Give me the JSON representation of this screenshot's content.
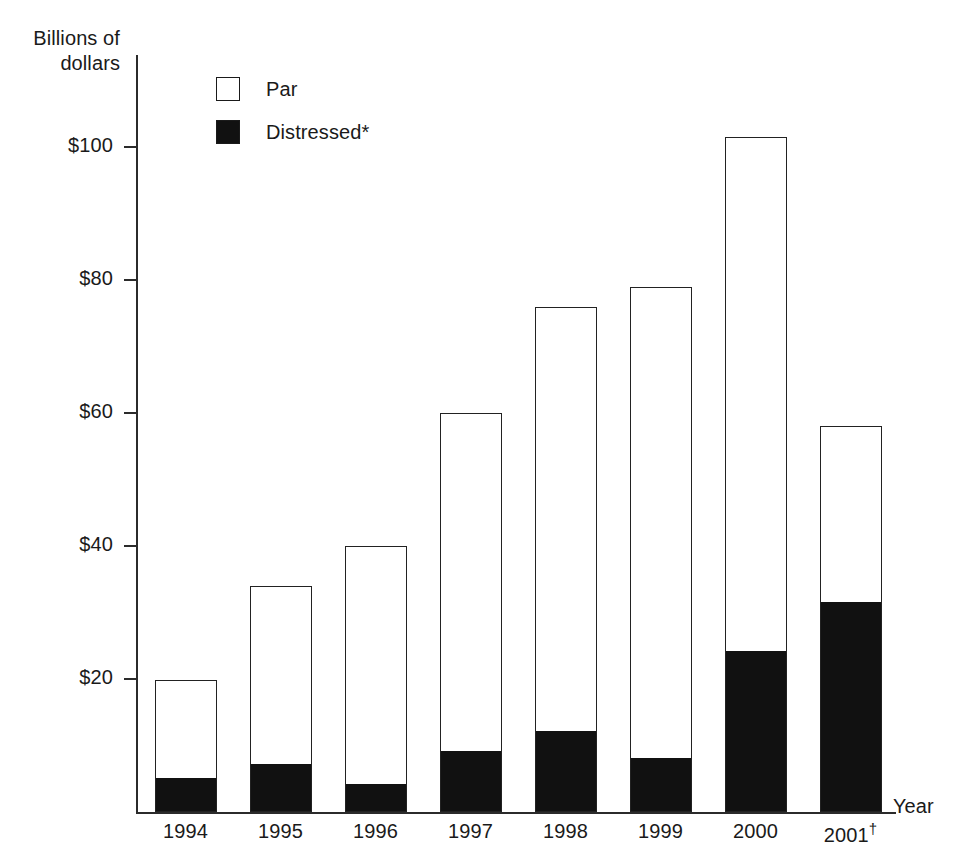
{
  "chart_data": {
    "type": "bar",
    "stacked": true,
    "title": "",
    "xlabel": "Year",
    "ylabel": "Billions of\ndollars",
    "ylim": [
      0,
      110
    ],
    "grid": false,
    "legend_position": "top-left-inside",
    "categories": [
      "1994",
      "1995",
      "1996",
      "1997",
      "1998",
      "1999",
      "2000",
      "2001†"
    ],
    "series": [
      {
        "name": "Distressed*",
        "swatch": "filled",
        "color": "#111111",
        "values": [
          5,
          7,
          4,
          9,
          12,
          8,
          24,
          31.5
        ]
      },
      {
        "name": "Par",
        "swatch": "hollow",
        "color": "#ffffff",
        "values": [
          14.8,
          27,
          36,
          51,
          64,
          71,
          77.5,
          26.5
        ]
      }
    ],
    "totals": [
      19.8,
      34,
      40,
      60,
      76,
      79,
      101.5,
      58
    ],
    "y_ticks": [
      {
        "value": 20,
        "label": "$20"
      },
      {
        "value": 40,
        "label": "$40"
      },
      {
        "value": 60,
        "label": "$60"
      },
      {
        "value": 80,
        "label": "$80"
      },
      {
        "value": 100,
        "label": "$100"
      }
    ]
  },
  "axis": {
    "y_title": "Billions of\ndollars",
    "x_title": "Year"
  },
  "legend": {
    "items": [
      {
        "label": "Par",
        "style": "hollow"
      },
      {
        "label": "Distressed*",
        "style": "filled"
      }
    ]
  },
  "y_tick_labels": [
    "$20",
    "$40",
    "$60",
    "$80",
    "$100"
  ],
  "x_tick_labels": [
    "1994",
    "1995",
    "1996",
    "1997",
    "1998",
    "1999",
    "2000",
    "2001"
  ],
  "x_tick_marks": [
    "",
    "",
    "",
    "",
    "",
    "",
    "",
    "†"
  ]
}
